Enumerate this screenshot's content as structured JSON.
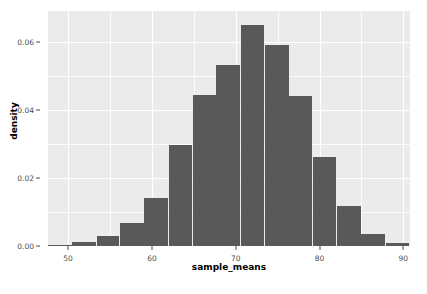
{
  "chart_data": {
    "type": "bar",
    "title": "",
    "subtitle": "",
    "xlabel": "sample_means",
    "ylabel": "density",
    "xlim": [
      47.6,
      90.8
    ],
    "ylim": [
      0,
      0.0692
    ],
    "grid": true,
    "legend": null,
    "bin_width": 2.88,
    "bar_color": "#595959",
    "panel_color": "#ebebeb",
    "gridline_color": "#ffffff",
    "axis_text_color": "#4d4d4d",
    "axis_title_color": "#000000",
    "x_ticks": [
      50,
      60,
      70,
      80,
      90
    ],
    "x_tick_labels": [
      "50",
      "60",
      "70",
      "80",
      "90"
    ],
    "y_ticks": [
      0.0,
      0.02,
      0.04,
      0.06
    ],
    "y_tick_labels": [
      "0.00",
      "0.02",
      "0.04",
      "0.06"
    ],
    "x_minor_ticks": [
      55,
      65,
      75,
      85
    ],
    "y_minor_ticks": [
      0.01,
      0.03,
      0.05
    ],
    "bins": [
      {
        "x0": 47.6,
        "x1": 50.5,
        "center": 49.0,
        "density": 0.0004
      },
      {
        "x0": 50.5,
        "x1": 53.4,
        "center": 51.9,
        "density": 0.0012
      },
      {
        "x0": 53.4,
        "x1": 56.2,
        "center": 54.8,
        "density": 0.0029
      },
      {
        "x0": 56.2,
        "x1": 59.1,
        "center": 57.7,
        "density": 0.0068
      },
      {
        "x0": 59.1,
        "x1": 62.0,
        "center": 60.5,
        "density": 0.0141
      },
      {
        "x0": 62.0,
        "x1": 64.9,
        "center": 63.4,
        "density": 0.0297
      },
      {
        "x0": 64.9,
        "x1": 67.7,
        "center": 66.3,
        "density": 0.0446
      },
      {
        "x0": 67.7,
        "x1": 70.6,
        "center": 69.2,
        "density": 0.0532
      },
      {
        "x0": 70.6,
        "x1": 73.5,
        "center": 72.0,
        "density": 0.065
      },
      {
        "x0": 73.5,
        "x1": 76.4,
        "center": 74.9,
        "density": 0.0591
      },
      {
        "x0": 76.4,
        "x1": 79.2,
        "center": 77.8,
        "density": 0.0441
      },
      {
        "x0": 79.2,
        "x1": 82.1,
        "center": 80.7,
        "density": 0.0262
      },
      {
        "x0": 82.1,
        "x1": 85.0,
        "center": 83.5,
        "density": 0.0118
      },
      {
        "x0": 85.0,
        "x1": 87.9,
        "center": 86.4,
        "density": 0.0035
      },
      {
        "x0": 87.9,
        "x1": 90.8,
        "center": 89.3,
        "density": 0.0009
      }
    ],
    "categories": [
      "49.0",
      "51.9",
      "54.8",
      "57.7",
      "60.5",
      "63.4",
      "66.3",
      "69.2",
      "72.0",
      "74.9",
      "77.8",
      "80.7",
      "83.5",
      "86.4",
      "89.3"
    ],
    "values": [
      0.0004,
      0.0012,
      0.0029,
      0.0068,
      0.0141,
      0.0297,
      0.0446,
      0.0532,
      0.065,
      0.0591,
      0.0441,
      0.0262,
      0.0118,
      0.0035,
      0.0009
    ]
  }
}
